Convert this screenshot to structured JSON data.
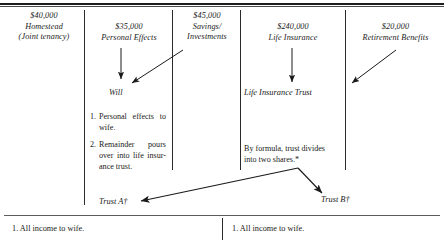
{
  "diagram": {
    "title_hidden": "Estate distribution flow chart",
    "columns": [
      {
        "id": "homestead",
        "amount": "$40,000",
        "line2": "Homestead",
        "line3": "(Joint tenancy)"
      },
      {
        "id": "personal-effects",
        "amount": "$35,000",
        "line2": "Personal Effects",
        "line3": ""
      },
      {
        "id": "savings-investments",
        "amount": "$45,000",
        "line2": "Savings/",
        "line3": "Investments"
      },
      {
        "id": "life-insurance",
        "amount": "$240,000",
        "line2": "Life Insurance",
        "line3": ""
      },
      {
        "id": "retirement-benefits",
        "amount": "$20,000",
        "line2": "Retirement Benefits",
        "line3": ""
      }
    ],
    "nodes": {
      "will": "Will",
      "life_insurance_trust": "Life Insurance Trust",
      "trust_a": "Trust A†",
      "trust_b": "Trust B†"
    },
    "will_provisions": [
      {
        "number": "1.",
        "lines": [
          "Personal effects to",
          "wife."
        ]
      },
      {
        "number": "2.",
        "lines": [
          "Remainder pours",
          "over into life insur-",
          "ance trust."
        ]
      }
    ],
    "trust_note": {
      "lines": [
        "By formula, trust divides",
        "into two shares.*"
      ]
    },
    "bottom_cells": [
      {
        "id": "trust-a-terms",
        "text": "1. All income to wife."
      },
      {
        "id": "trust-b-terms",
        "text": "1. All income to wife."
      }
    ],
    "colors": {
      "ink": "#1a1a1a",
      "rule": "#2b2b2b",
      "background": "#ffffff"
    }
  }
}
